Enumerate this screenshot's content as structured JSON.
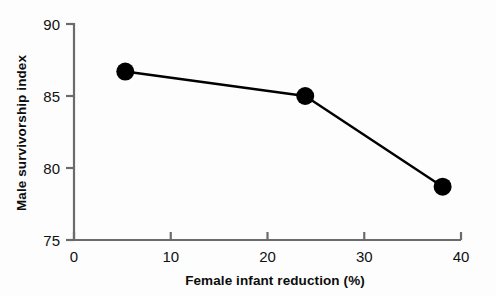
{
  "chart_data": {
    "type": "line",
    "title": "",
    "xlabel": "Female infant reduction (%)",
    "ylabel": "Male survivorship index",
    "xlim": [
      0,
      40
    ],
    "ylim": [
      75,
      90
    ],
    "xticks": [
      0,
      10,
      20,
      30,
      40
    ],
    "yticks": [
      75,
      80,
      85,
      90
    ],
    "xtick_labels": [
      "0",
      "10",
      "20",
      "30",
      "40"
    ],
    "ytick_labels": [
      "75",
      "80",
      "85",
      "90"
    ],
    "grid": false,
    "legend": null,
    "series": [
      {
        "name": "Male survivorship index",
        "marker": "filled-circle",
        "marker_color": "#000000",
        "line_color": "#000000",
        "x": [
          5.3,
          23.9,
          38.1
        ],
        "y": [
          86.7,
          85.0,
          78.7
        ]
      }
    ],
    "points": [
      {
        "label": "point-1",
        "x": 5.3,
        "y": 86.7
      },
      {
        "label": "point-2",
        "x": 23.9,
        "y": 85.0
      },
      {
        "label": "point-3",
        "x": 38.1,
        "y": 78.7
      }
    ]
  },
  "axes": {
    "x_title": "Female infant reduction (%)",
    "y_title": "Male survivorship index",
    "x_tick_0": "0",
    "x_tick_1": "10",
    "x_tick_2": "20",
    "x_tick_3": "30",
    "x_tick_4": "40",
    "y_tick_0": "75",
    "y_tick_1": "80",
    "y_tick_2": "85",
    "y_tick_3": "90"
  },
  "style": {
    "axis_color": "#6b6b6b",
    "data_color": "#000000",
    "background": "#fdfdfd",
    "text_color": "#111111"
  }
}
